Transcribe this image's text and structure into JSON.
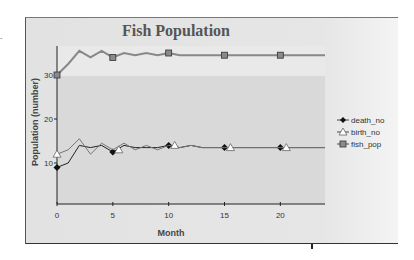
{
  "page": {
    "stray_mark": "-"
  },
  "chart_data": {
    "type": "line",
    "title": "Fish Population",
    "xlabel": "Month",
    "ylabel": "Population (number)",
    "xlim": [
      0,
      24
    ],
    "ylim": [
      0,
      36
    ],
    "x_ticks": [
      0,
      5,
      10,
      15,
      20
    ],
    "y_ticks": [
      10,
      20,
      30
    ],
    "grid": false,
    "legend_position": "right",
    "x": [
      0,
      1,
      2,
      3,
      4,
      5,
      6,
      7,
      8,
      9,
      10,
      11,
      12,
      13,
      14,
      15,
      16,
      17,
      18,
      19,
      20,
      21,
      22,
      23,
      24
    ],
    "series": [
      {
        "name": "death_no",
        "marker": "diamond",
        "color": "#222222",
        "values": [
          9,
          10,
          14,
          13.5,
          14,
          12.5,
          14,
          13.5,
          13.5,
          13.5,
          14,
          13.5,
          14,
          13.5,
          13.5,
          13.5,
          13.5,
          13.5,
          13.5,
          13.5,
          13.5,
          13.5,
          13.5,
          13.5,
          13.5
        ]
      },
      {
        "name": "birth_no",
        "marker": "triangle",
        "color": "#777777",
        "values": [
          12,
          13,
          15.5,
          12,
          14.5,
          13,
          14.5,
          13,
          14,
          13,
          14,
          13.5,
          14,
          13.5,
          13.5,
          13.5,
          13.5,
          13.5,
          13.5,
          13.5,
          13.5,
          13.5,
          13.5,
          13.5,
          13.5
        ]
      },
      {
        "name": "fish_pop",
        "marker": "square",
        "color": "#888888",
        "values": [
          30,
          32.5,
          35.5,
          34,
          35.5,
          34,
          35,
          34.5,
          35,
          34.5,
          35,
          34.5,
          34.5,
          34.5,
          34.5,
          34.5,
          34.5,
          34.5,
          34.5,
          34.5,
          34.5,
          34.5,
          34.5,
          34.5,
          34.5
        ]
      }
    ],
    "marker_x": [
      0,
      5,
      10,
      15,
      20
    ]
  }
}
